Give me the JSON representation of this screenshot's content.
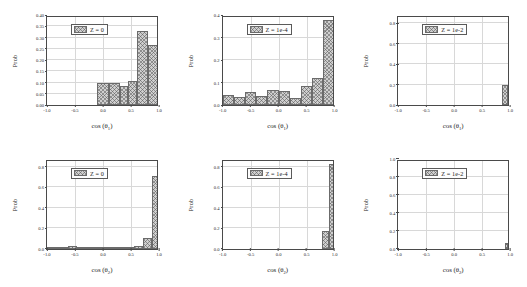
{
  "figure": {
    "rows": 2,
    "cols": 3,
    "background": "#ffffff",
    "bar_fill": "#cfcfcf",
    "bar_edge": "#6b6b6b",
    "axis_color": "#4a4a4a",
    "grid_color": "#d8d8d8"
  },
  "chart_data": [
    {
      "type": "bar",
      "panel_id": "panel-1",
      "title": "",
      "legend": "Z = 0",
      "legend_position": "upper-left",
      "xlabel": "cos (θ",
      "xlabel_sub": "1",
      "xlabel_close": ")",
      "ylabel": "Prob",
      "xlim": [
        -1.0,
        1.0
      ],
      "ylim": [
        0.0,
        0.4
      ],
      "grid": true,
      "xticks": [
        -1.0,
        -0.5,
        0.0,
        0.5,
        1.0
      ],
      "xticklabels": [
        "-1.0",
        "-0.5",
        "0.0",
        "0.5",
        "1.0"
      ],
      "yticks": [
        0.0,
        0.05,
        0.1,
        0.15,
        0.2,
        0.25,
        0.3,
        0.35,
        0.4
      ],
      "yticklabels": [
        "0.00",
        "0.05",
        "0.10",
        "0.15",
        "0.20",
        "0.25",
        "0.30",
        "0.35",
        "0.40"
      ],
      "bin_edges": [
        -0.1,
        0.1,
        0.3,
        0.45,
        0.6,
        0.8,
        1.0
      ],
      "values": [
        0.1,
        0.1,
        0.085,
        0.105,
        0.33,
        0.268
      ]
    },
    {
      "type": "bar",
      "panel_id": "panel-2",
      "title": "",
      "legend": "Z = 1e-4",
      "legend_position": "upper-left",
      "xlabel": "cos (θ",
      "xlabel_sub": "1",
      "xlabel_close": ")",
      "ylabel": "Prob",
      "xlim": [
        -1.0,
        1.0
      ],
      "ylim": [
        0.0,
        0.4
      ],
      "grid": true,
      "xticks": [
        -1.0,
        -0.5,
        0.0,
        0.5,
        1.0
      ],
      "xticklabels": [
        "-1.0",
        "-0.5",
        "0.0",
        "0.5",
        "1.0"
      ],
      "yticks": [
        0.0,
        0.1,
        0.2,
        0.3,
        0.4
      ],
      "yticklabels": [
        "0.0",
        "0.1",
        "0.2",
        "0.3",
        "0.4"
      ],
      "bin_edges": [
        -1.0,
        -0.8,
        -0.6,
        -0.4,
        -0.2,
        0.0,
        0.2,
        0.4,
        0.6,
        0.8,
        1.0
      ],
      "values": [
        0.046,
        0.034,
        0.058,
        0.042,
        0.068,
        0.064,
        0.032,
        0.085,
        0.122,
        0.378
      ]
    },
    {
      "type": "bar",
      "panel_id": "panel-3",
      "title": "",
      "legend": "Z = 1e-2",
      "legend_position": "upper-left",
      "xlabel": "cos (θ",
      "xlabel_sub": "1",
      "xlabel_close": ")",
      "ylabel": "Prob",
      "xlim": [
        -1.0,
        1.0
      ],
      "ylim": [
        0.0,
        0.88
      ],
      "grid": true,
      "xticks": [
        -1.0,
        -0.5,
        0.0,
        0.5,
        1.0
      ],
      "xticklabels": [
        "-1.0",
        "-0.5",
        "0.0",
        "0.5",
        "1.0"
      ],
      "yticks": [
        0.0,
        0.2,
        0.4,
        0.6,
        0.8
      ],
      "yticklabels": [
        "0.0",
        "0.2",
        "0.4",
        "0.6",
        "0.8"
      ],
      "bin_edges": [
        0.86,
        0.96,
        1.0
      ],
      "values": [
        0.2,
        0.742
      ]
    },
    {
      "type": "bar",
      "panel_id": "panel-4",
      "title": "",
      "legend": "Z = 0",
      "legend_position": "upper-left",
      "xlabel": "cos (θ",
      "xlabel_sub": "2",
      "xlabel_close": ")",
      "ylabel": "Prob",
      "xlim": [
        -1.0,
        1.0
      ],
      "ylim": [
        0.0,
        0.88
      ],
      "grid": true,
      "xticks": [
        -1.0,
        -0.5,
        0.0,
        0.5,
        1.0
      ],
      "xticklabels": [
        "-1.0",
        "-0.5",
        "0.0",
        "0.5",
        "1.0"
      ],
      "yticks": [
        0.0,
        0.2,
        0.4,
        0.6,
        0.8
      ],
      "yticklabels": [
        "0.0",
        "0.2",
        "0.4",
        "0.6",
        "0.8"
      ],
      "bin_edges": [
        -1.0,
        -0.62,
        -0.46,
        -0.1,
        0.1,
        0.3,
        0.55,
        0.72,
        0.88,
        1.0
      ],
      "values": [
        0.004,
        0.022,
        0.004,
        0.01,
        0.012,
        0.006,
        0.022,
        0.104,
        0.71
      ]
    },
    {
      "type": "bar",
      "panel_id": "panel-5",
      "title": "",
      "legend": "Z = 1e-4",
      "legend_position": "upper-left",
      "xlabel": "cos (θ",
      "xlabel_sub": "2",
      "xlabel_close": ")",
      "ylabel": "Prob",
      "xlim": [
        -1.0,
        1.0
      ],
      "ylim": [
        0.0,
        0.88
      ],
      "grid": true,
      "xticks": [
        -1.0,
        -0.5,
        0.0,
        0.5,
        1.0
      ],
      "xticklabels": [
        "-1.0",
        "-0.5",
        "0.0",
        "0.5",
        "1.0"
      ],
      "yticks": [
        0.0,
        0.2,
        0.4,
        0.6,
        0.8
      ],
      "yticklabels": [
        "0.0",
        "0.2",
        "0.4",
        "0.6",
        "0.8"
      ],
      "bin_edges": [
        0.78,
        0.9,
        1.0
      ],
      "values": [
        0.176,
        0.826
      ]
    },
    {
      "type": "bar",
      "panel_id": "panel-6",
      "title": "",
      "legend": "Z = 1e-2",
      "legend_position": "upper-left",
      "xlabel": "cos (θ",
      "xlabel_sub": "2",
      "xlabel_close": ")",
      "ylabel": "Prob",
      "xlim": [
        -1.0,
        1.0
      ],
      "ylim": [
        0.0,
        1.0
      ],
      "grid": true,
      "xticks": [
        -1.0,
        -0.5,
        0.0,
        0.5,
        1.0
      ],
      "xticklabels": [
        "-1.0",
        "-0.5",
        "0.0",
        "0.5",
        "1.0"
      ],
      "yticks": [
        0.0,
        0.2,
        0.4,
        0.6,
        0.8,
        1.0
      ],
      "yticklabels": [
        "0.0",
        "0.2",
        "0.4",
        "0.6",
        "0.8",
        "1.0"
      ],
      "bin_edges": [
        0.9,
        0.97,
        1.0
      ],
      "values": [
        0.058,
        0.962
      ]
    }
  ]
}
